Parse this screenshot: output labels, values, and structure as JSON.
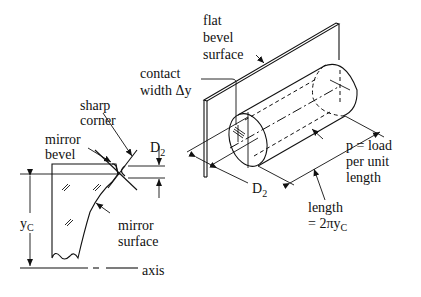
{
  "diagram": {
    "left_view": {
      "labels": {
        "sharp_corner_1": "sharp",
        "sharp_corner_2": "corner",
        "mirror_bevel_1": "mirror",
        "mirror_bevel_2": "bevel",
        "d2": "D",
        "d2_sub": "2",
        "yc": "y",
        "yc_sub": "C",
        "mirror_surface_1": "mirror",
        "mirror_surface_2": "surface",
        "axis": "axis"
      }
    },
    "right_view": {
      "labels": {
        "flat_bevel_1": "flat",
        "flat_bevel_2": "bevel",
        "flat_bevel_3": "surface",
        "contact_width_1": "contact",
        "contact_width_2": "width Δy",
        "d2": "D",
        "d2_sub": "2",
        "load_1": "p = load",
        "load_2": "per unit",
        "load_3": "length",
        "length_1": "length",
        "length_2": "= 2πy",
        "length_sub": "C"
      }
    }
  }
}
